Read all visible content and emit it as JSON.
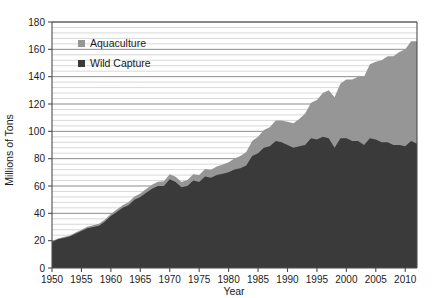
{
  "chart_data": {
    "type": "area",
    "stacked": true,
    "title": "",
    "xlabel": "Year",
    "ylabel": "Millions of Tons",
    "xlim": [
      1950,
      2012
    ],
    "ylim": [
      0,
      180
    ],
    "xticks": [
      1950,
      1955,
      1960,
      1965,
      1970,
      1975,
      1980,
      1985,
      1990,
      1995,
      2000,
      2005,
      2010
    ],
    "yticks": [
      0,
      20,
      40,
      60,
      80,
      100,
      120,
      140,
      160,
      180
    ],
    "minor_y_step": 4,
    "grid": true,
    "grid_axis": "y",
    "legend_position": "top-left-inside",
    "colors": {
      "aquaculture": "#969696",
      "wild_capture": "#3a3a3a",
      "grid_major": "#8c8c8c",
      "grid_minor": "#d8d8d8",
      "axis": "#4d4d4d",
      "text": "#1a1a1a",
      "background": "#ffffff"
    },
    "legend": [
      {
        "label": "Aquaculture",
        "color": "#969696",
        "marker": "square"
      },
      {
        "label": "Wild Capture",
        "color": "#3a3a3a",
        "marker": "square"
      }
    ],
    "x": [
      1950,
      1951,
      1952,
      1953,
      1954,
      1955,
      1956,
      1957,
      1958,
      1959,
      1960,
      1961,
      1962,
      1963,
      1964,
      1965,
      1966,
      1967,
      1968,
      1969,
      1970,
      1971,
      1972,
      1973,
      1974,
      1975,
      1976,
      1977,
      1978,
      1979,
      1980,
      1981,
      1982,
      1983,
      1984,
      1985,
      1986,
      1987,
      1988,
      1989,
      1990,
      1991,
      1992,
      1993,
      1994,
      1995,
      1996,
      1997,
      1998,
      1999,
      2000,
      2001,
      2002,
      2003,
      2004,
      2005,
      2006,
      2007,
      2008,
      2009,
      2010,
      2011,
      2012
    ],
    "series": [
      {
        "name": "Wild Capture",
        "color": "#3a3a3a",
        "values": [
          19,
          21,
          22,
          23,
          25,
          27,
          29,
          30,
          31,
          34,
          38,
          41,
          44,
          46,
          50,
          52,
          55,
          58,
          60,
          60,
          65,
          63,
          59,
          60,
          64,
          63,
          67,
          66,
          68,
          69,
          70,
          72,
          73,
          75,
          82,
          84,
          88,
          89,
          93,
          92,
          90,
          88,
          89,
          90,
          95,
          94,
          96,
          95,
          88,
          95,
          95,
          93,
          93,
          90,
          95,
          94,
          92,
          92,
          90,
          90,
          89,
          93,
          91
        ]
      },
      {
        "name": "Aquaculture",
        "color": "#969696",
        "values": [
          0.5,
          0.6,
          0.7,
          0.8,
          0.9,
          1.0,
          1.1,
          1.2,
          1.3,
          1.4,
          1.6,
          1.8,
          2.0,
          2.2,
          2.4,
          2.6,
          2.8,
          3.0,
          3.2,
          3.4,
          3.6,
          3.8,
          4.0,
          4.3,
          4.6,
          5.0,
          5.4,
          5.8,
          6.3,
          6.8,
          7.4,
          8.2,
          9.0,
          9.8,
          11,
          12,
          13,
          14,
          15,
          16,
          17,
          18,
          20,
          23,
          26,
          29,
          32,
          35,
          37,
          40,
          43,
          45,
          47,
          50,
          54,
          57,
          60,
          63,
          65,
          68,
          71,
          73,
          75
        ]
      }
    ],
    "total_values": [
      19.5,
      21.6,
      22.7,
      23.8,
      25.9,
      28,
      30.1,
      31.2,
      32.3,
      35.4,
      39.6,
      42.8,
      46,
      48.2,
      52.4,
      54.6,
      57.8,
      61,
      63.2,
      63.4,
      68.6,
      66.8,
      63,
      64.3,
      68.6,
      68,
      72.4,
      71.8,
      74.3,
      75.8,
      77.4,
      80.2,
      82,
      84.8,
      93,
      96,
      101,
      103,
      108,
      108,
      107,
      106,
      109,
      113,
      121,
      123,
      128,
      130,
      125,
      135,
      138,
      138,
      140,
      140,
      149,
      151,
      152,
      155,
      155,
      158,
      160,
      166,
      166
    ]
  }
}
